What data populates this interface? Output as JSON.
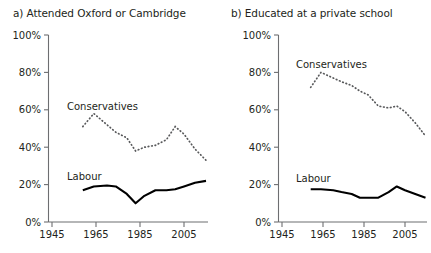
{
  "figure": {
    "background_color": "#ffffff",
    "line_color": "#000000",
    "axis_color": "#6d6e71"
  },
  "panels": [
    {
      "key": "panel_a",
      "title": "a) Attended Oxford or Cambridge",
      "series_labels": {
        "conservatives": "Conservatives",
        "labour": "Labour"
      },
      "y_ticks": [
        "100%",
        "80%",
        "60%",
        "40%",
        "20%",
        "0%"
      ],
      "x_ticks": [
        "1945",
        "1965",
        "1985",
        "2005"
      ]
    },
    {
      "key": "panel_b",
      "title": "b) Educated at a private school",
      "series_labels": {
        "conservatives": "Conservatives",
        "labour": "Labour"
      },
      "y_ticks": [
        "100%",
        "80%",
        "60%",
        "40%",
        "20%",
        "0%"
      ],
      "x_ticks": [
        "1945",
        "1965",
        "1985",
        "2005"
      ]
    }
  ],
  "chart_data": [
    {
      "type": "line",
      "title": "a) Attended Oxford or Cambridge",
      "xlabel": "",
      "ylabel": "",
      "xlim": [
        1945,
        2016
      ],
      "ylim": [
        0,
        100
      ],
      "ytick_values": [
        0,
        20,
        40,
        60,
        80,
        100
      ],
      "ytick_labels": [
        "0%",
        "20%",
        "40%",
        "60%",
        "80%",
        "100%"
      ],
      "xtick_values": [
        1945,
        1965,
        1985,
        2005
      ],
      "xtick_labels": [
        "1945",
        "1965",
        "1985",
        "2005"
      ],
      "grid": false,
      "legend": "inline-annotation",
      "series": [
        {
          "name": "Conservatives",
          "style": "dotted",
          "x": [
            1959,
            1964,
            1970,
            1974,
            1979,
            1983,
            1987,
            1992,
            1997,
            2001,
            2005,
            2010,
            2015
          ],
          "values": [
            51,
            58,
            52,
            48,
            45,
            38,
            40,
            41,
            44,
            51,
            47,
            39,
            33
          ]
        },
        {
          "name": "Labour",
          "style": "solid",
          "x": [
            1959,
            1964,
            1970,
            1974,
            1979,
            1983,
            1987,
            1992,
            1997,
            2001,
            2005,
            2010,
            2015
          ],
          "values": [
            17,
            19,
            19.5,
            19,
            15,
            10,
            14,
            17,
            17,
            17.5,
            19,
            21,
            22
          ]
        }
      ]
    },
    {
      "type": "line",
      "title": "b) Educated at a private school",
      "xlabel": "",
      "ylabel": "",
      "xlim": [
        1945,
        2016
      ],
      "ylim": [
        0,
        100
      ],
      "ytick_values": [
        0,
        20,
        40,
        60,
        80,
        100
      ],
      "ytick_labels": [
        "0%",
        "20%",
        "40%",
        "60%",
        "80%",
        "100%"
      ],
      "xtick_values": [
        1945,
        1965,
        1985,
        2005
      ],
      "xtick_labels": [
        "1945",
        "1965",
        "1985",
        "2005"
      ],
      "grid": false,
      "legend": "inline-annotation",
      "series": [
        {
          "name": "Conservatives",
          "style": "dotted",
          "x": [
            1959,
            1964,
            1970,
            1974,
            1979,
            1983,
            1987,
            1992,
            1997,
            2001,
            2005,
            2010,
            2015
          ],
          "values": [
            72,
            80,
            77,
            75,
            73,
            70,
            68,
            62,
            61,
            62,
            59,
            53,
            46
          ]
        },
        {
          "name": "Labour",
          "style": "solid",
          "x": [
            1959,
            1964,
            1970,
            1974,
            1979,
            1983,
            1987,
            1992,
            1997,
            2001,
            2005,
            2010,
            2015
          ],
          "values": [
            17.5,
            17.5,
            17,
            16,
            15,
            13,
            13,
            13,
            16,
            19,
            17,
            15,
            13
          ]
        }
      ]
    }
  ]
}
